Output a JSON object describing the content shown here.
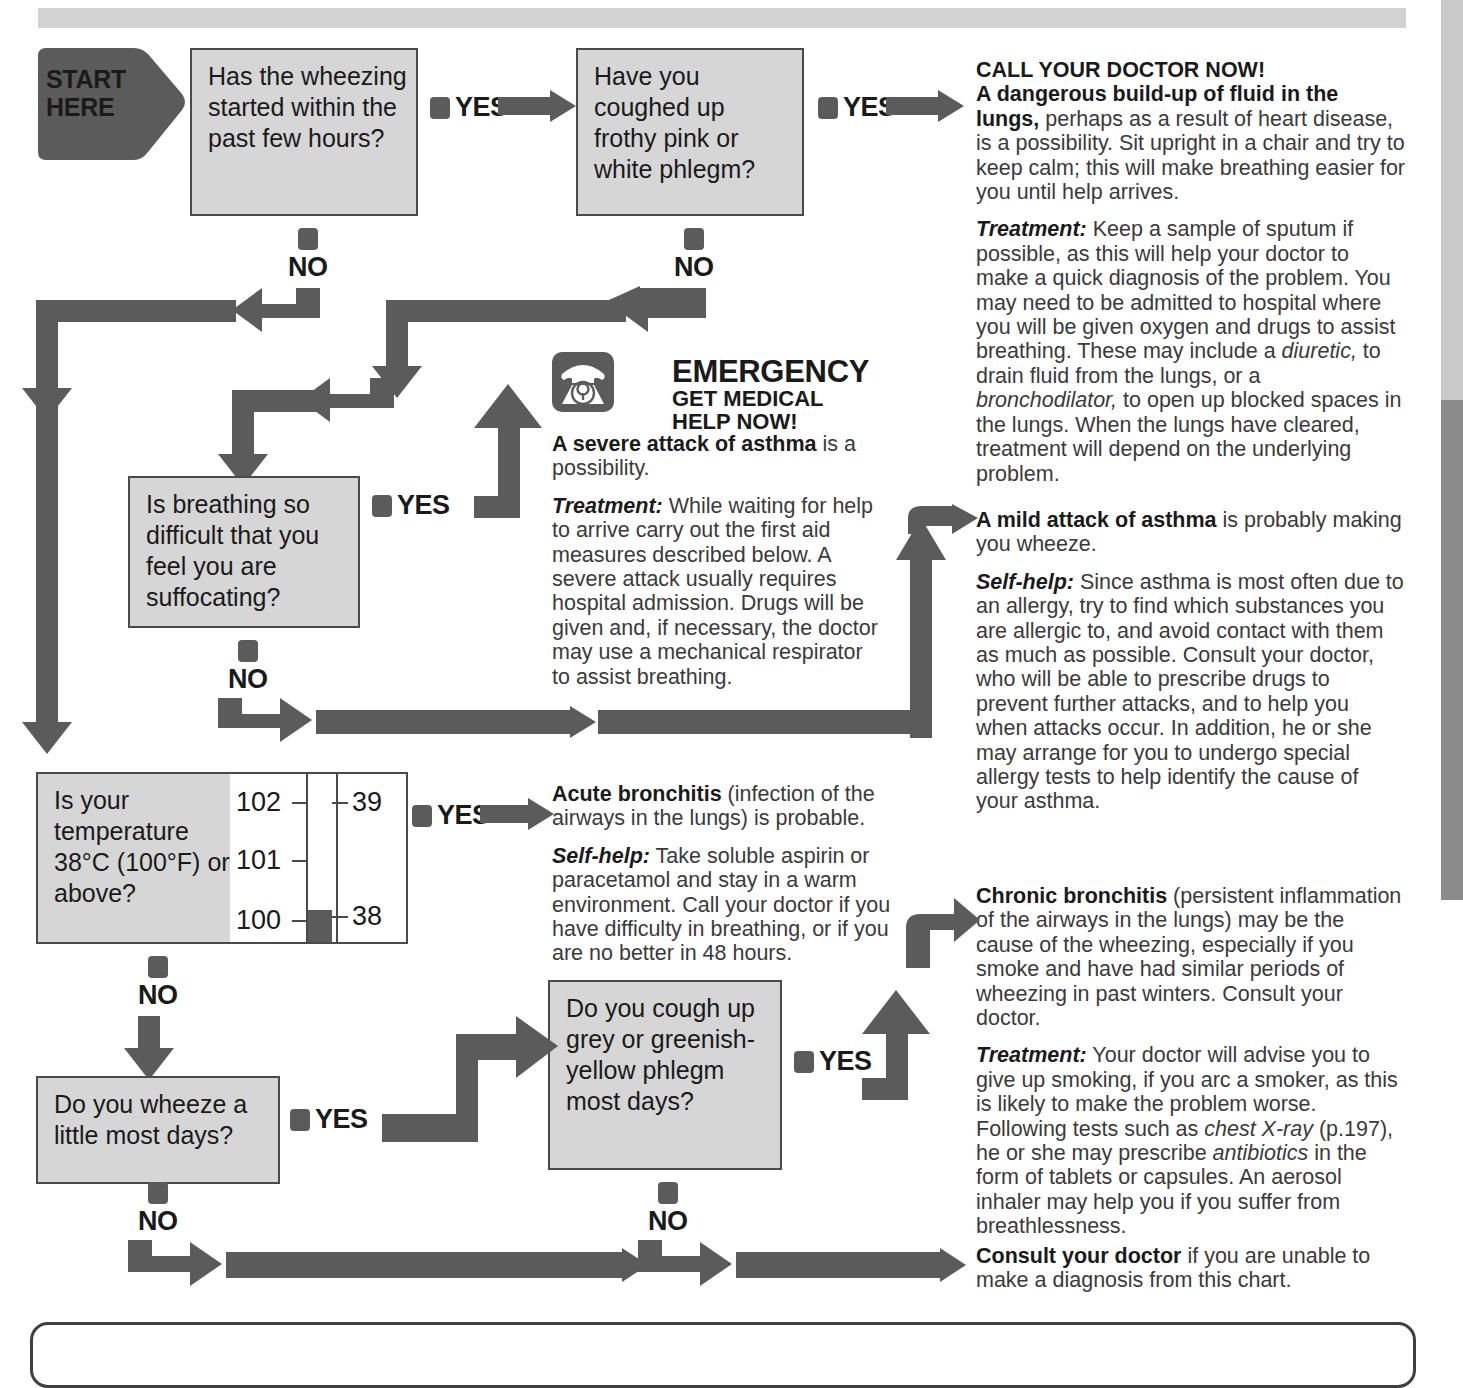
{
  "chart_title": "Wheezing self-diagnosis flowchart",
  "start": {
    "line1": "START",
    "line2": "HERE"
  },
  "labels": {
    "yes": "YES",
    "no": "NO"
  },
  "questions": [
    {
      "id": "q1",
      "text": "Has the wheezing started within the past few hours?"
    },
    {
      "id": "q2",
      "text": "Have you coughed up frothy pink or white phlegm?"
    },
    {
      "id": "q3",
      "text": "Is breathing so difficult that you feel you are suffocating?"
    },
    {
      "id": "q4",
      "text": "Is your temperature 38°C (100°F) or above?"
    },
    {
      "id": "q5",
      "text": "Do you wheeze a little most days?"
    },
    {
      "id": "q6",
      "text": "Do you cough up grey or greenish-yellow phlegm most days?"
    }
  ],
  "thermometer": {
    "fahrenheit_ticks": [
      "102",
      "101",
      "100"
    ],
    "celsius_ticks": [
      "39",
      "38"
    ],
    "mercury_level_f": 100,
    "mercury_level_c": 38
  },
  "emergency": {
    "icon": "telephone-icon",
    "heading_line1": "EMERGENCY",
    "heading_line2": "GET MEDICAL",
    "heading_line3": "HELP NOW!"
  },
  "advice": {
    "call_doctor": {
      "heading": "CALL YOUR DOCTOR NOW!",
      "lead_bold": "A dangerous build-up of fluid in the lungs,",
      "lead_rest": " perhaps as a result of heart disease, is a possibility. Sit upright in a chair and try to keep calm; this will make breathing easier for you until help arrives.",
      "treatment_label": "Treatment:",
      "treatment_part1": " Keep a sample of sputum if possible, as this will help your doctor to make a quick diagnosis of the problem. You may need to be admitted to hospital where you will be given oxygen and drugs to assist breathing. These may include a ",
      "treatment_em1": "diuretic,",
      "treatment_part2": " to drain fluid from the lungs, or a ",
      "treatment_em2": "bronchodilator,",
      "treatment_part3": " to open up blocked spaces in the lungs. When the lungs have cleared, treatment will depend on the underlying problem."
    },
    "severe_asthma": {
      "lead_bold": "A severe attack of asthma",
      "lead_rest": " is a possibility.",
      "treatment_label": "Treatment:",
      "treatment_text": " While waiting for help to arrive carry out the first aid measures described below. A severe attack usually requires hospital admission. Drugs will be given and, if necessary, the doctor may use a mechanical respirator to assist breathing."
    },
    "mild_asthma": {
      "lead_bold": "A mild attack of asthma",
      "lead_rest": " is probably making you wheeze.",
      "selfhelp_label": "Self-help:",
      "selfhelp_text": " Since asthma is most often due to an allergy, try to find which substances you are allergic to, and avoid contact with them as much as possible. Consult your doctor, who will be able to prescribe drugs to prevent further attacks, and to help you when attacks occur. In addition, he or she may arrange for you to undergo special allergy tests to help identify the cause of your asthma."
    },
    "acute_bronchitis": {
      "lead_bold": "Acute bronchitis",
      "lead_rest": " (infection of the airways in the lungs) is probable.",
      "selfhelp_label": "Self-help:",
      "selfhelp_text": " Take soluble aspirin or paracetamol and stay in a warm environment. Call your doctor if you have difficulty in breathing, or if you are no better in 48 hours."
    },
    "chronic_bronchitis": {
      "lead_bold": "Chronic bronchitis",
      "lead_rest": " (persistent inflammation of the airways in the lungs) may be the cause of the wheezing, especially if you smoke and have had similar periods of wheezing in past winters. Consult your doctor.",
      "treatment_label": "Treatment:",
      "treatment_part1": " Your doctor will advise you to give up smoking, if you arc a smoker, as this is likely to make the problem worse. Following tests such as ",
      "treatment_em1": "chest X-ray",
      "treatment_part2": " (p.197), he or she may prescribe ",
      "treatment_em2": "antibiotics",
      "treatment_part3": " in the form of tablets or capsules. An aerosol inhaler may help you if you suffer from breathlessness."
    },
    "consult_doctor": {
      "lead_bold": "Consult your doctor",
      "lead_rest": " if you are unable to make a diagnosis from this chart."
    }
  },
  "colors": {
    "arrow": "#5b5b5b",
    "box_fill": "#d6d6d6",
    "box_border": "#4a4a4a",
    "text": "#3a3a3a",
    "heading": "#1a1a1a",
    "header_bar": "#d2d2d2"
  }
}
